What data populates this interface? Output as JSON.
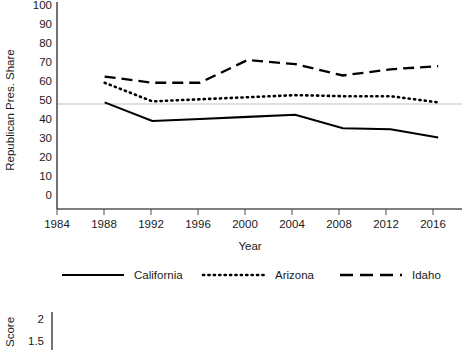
{
  "chart_data": {
    "type": "line",
    "title": "",
    "xlabel": "Year",
    "ylabel": "Republican Pres. Share",
    "x": [
      1988,
      1992,
      1996,
      2000,
      2004,
      2008,
      2012,
      2016
    ],
    "xlim": [
      1984,
      2018
    ],
    "ylim": [
      0,
      100
    ],
    "xticks": [
      "1984",
      "1988",
      "1992",
      "1996",
      "2000",
      "2004",
      "2008",
      "2012",
      "2016"
    ],
    "yticks": [
      "0",
      "10",
      "20",
      "30",
      "40",
      "50",
      "60",
      "70",
      "80",
      "90",
      "100"
    ],
    "grid": "horizontal-at-50",
    "gridline_value": 50,
    "legend_position": "bottom",
    "series": [
      {
        "name": "California",
        "style": "solid",
        "values": [
          51.5,
          42.5,
          43.5,
          44.5,
          45.5,
          39.0,
          38.5,
          34.5
        ]
      },
      {
        "name": "Arizona",
        "style": "dotted",
        "values": [
          61.0,
          52.0,
          53.0,
          54.0,
          55.0,
          54.5,
          54.5,
          51.5
        ]
      },
      {
        "name": "Idaho",
        "style": "dashed",
        "values": [
          64.0,
          61.0,
          61.0,
          72.0,
          70.0,
          64.5,
          67.5,
          69.0
        ]
      }
    ]
  },
  "legend": {
    "items": [
      {
        "label": "California",
        "style": "solid"
      },
      {
        "label": "Arizona",
        "style": "dotted"
      },
      {
        "label": "Idaho",
        "style": "dashed"
      }
    ]
  },
  "lower_chart": {
    "ylabel": "Score",
    "yticks": [
      "2",
      "1.5"
    ]
  }
}
